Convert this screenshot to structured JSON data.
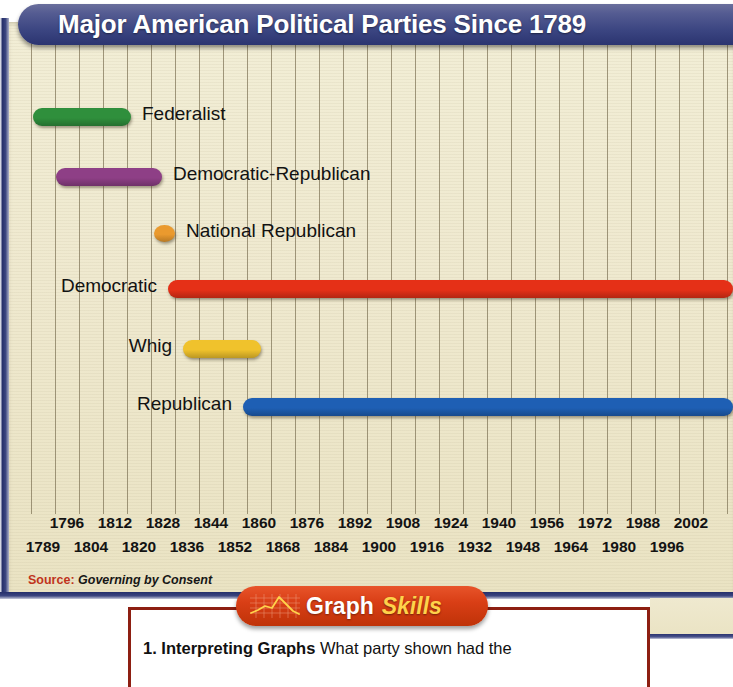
{
  "header": {
    "title": "Major American Political Parties Since 1789"
  },
  "source": {
    "label": "Source:",
    "value": "Governing by Consent"
  },
  "banner": {
    "word1": "Graph",
    "word2": "Skills",
    "icon": "line-graph-icon"
  },
  "question": {
    "number": "1.",
    "bold": "Interpreting Graphs",
    "text": "What party shown had the"
  },
  "chart_data": {
    "type": "bar",
    "orientation": "horizontal-timeline",
    "title": "Major American Political Parties Since 1789",
    "xlabel": "",
    "ylabel": "",
    "xlim": [
      1789,
      2004
    ],
    "grid": true,
    "grid_interval_years": 8,
    "legend": "inline-labels",
    "tick_labels_top": [
      "1796",
      "1812",
      "1828",
      "1844",
      "1860",
      "1876",
      "1892",
      "1908",
      "1924",
      "1940",
      "1956",
      "1972",
      "1988",
      "2002"
    ],
    "tick_labels_bottom": [
      "1789",
      "1804",
      "1820",
      "1836",
      "1852",
      "1868",
      "1884",
      "1900",
      "1916",
      "1932",
      "1948",
      "1964",
      "1980",
      "1996"
    ],
    "series": [
      {
        "name": "Federalist",
        "color": "#2f8f3c",
        "start_year": 1789,
        "end_year": 1820,
        "label_side": "right",
        "bar_px": {
          "left": 27,
          "width": 98
        },
        "row_top": 78
      },
      {
        "name": "Democratic-Republican",
        "color": "#8e3f86",
        "start_year": 1796,
        "end_year": 1832,
        "label_side": "right",
        "bar_px": {
          "left": 50,
          "width": 106
        },
        "row_top": 138
      },
      {
        "name": "National Republican",
        "color": "#ea9a2e",
        "start_year": 1828,
        "end_year": 1834,
        "label_side": "right",
        "bar_px": {
          "left": 148,
          "width": 21
        },
        "row_top": 195
      },
      {
        "name": "Democratic",
        "color": "#e53017",
        "start_year": 1828,
        "end_year": 2004,
        "label_side": "left",
        "bar_px": {
          "left": 162,
          "width": 565
        },
        "row_top": 250
      },
      {
        "name": "Whig",
        "color": "#f0c22c",
        "start_year": 1834,
        "end_year": 1856,
        "label_side": "left",
        "bar_px": {
          "left": 177,
          "width": 78
        },
        "row_top": 310
      },
      {
        "name": "Republican",
        "color": "#1e5fb4",
        "start_year": 1854,
        "end_year": 2004,
        "label_side": "left",
        "bar_px": {
          "left": 237,
          "width": 490
        },
        "row_top": 368
      }
    ],
    "gridline_px": [
      25,
      49,
      73,
      97,
      121,
      145,
      169,
      193,
      217,
      241,
      265,
      289,
      313,
      337,
      361,
      385,
      409,
      433,
      457,
      481,
      505,
      529,
      553,
      577,
      601,
      625,
      649,
      673,
      697,
      721
    ],
    "tick_px_top": [
      61,
      109,
      157,
      205,
      253,
      301,
      349,
      397,
      445,
      493,
      541,
      589,
      637,
      685
    ],
    "tick_px_bottom": [
      37,
      85,
      133,
      181,
      229,
      277,
      325,
      373,
      421,
      469,
      517,
      565,
      613,
      661
    ]
  }
}
